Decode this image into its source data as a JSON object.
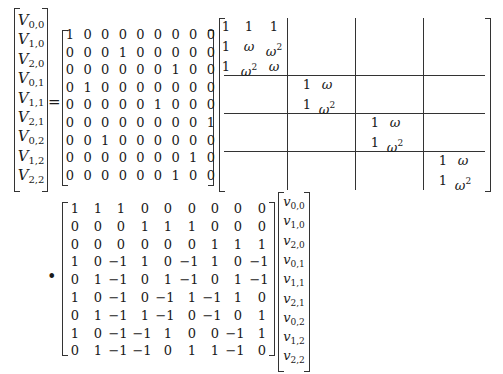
{
  "equation": {
    "lhs_vector": {
      "symbol": "V",
      "entries": [
        "0,0",
        "1,0",
        "2,0",
        "0,1",
        "1,1",
        "2,1",
        "0,2",
        "1,2",
        "2,2"
      ]
    },
    "equals": "=",
    "permutation_matrix": [
      [
        "1",
        "0",
        "0",
        "0",
        "0",
        "0",
        "0",
        "0",
        "0"
      ],
      [
        "0",
        "0",
        "0",
        "1",
        "0",
        "0",
        "0",
        "0",
        "0"
      ],
      [
        "0",
        "0",
        "0",
        "0",
        "0",
        "0",
        "1",
        "0",
        "0"
      ],
      [
        "0",
        "1",
        "0",
        "0",
        "0",
        "0",
        "0",
        "0",
        "0"
      ],
      [
        "0",
        "0",
        "0",
        "0",
        "0",
        "1",
        "0",
        "0",
        "0"
      ],
      [
        "0",
        "0",
        "0",
        "0",
        "0",
        "0",
        "0",
        "0",
        "1"
      ],
      [
        "0",
        "0",
        "1",
        "0",
        "0",
        "0",
        "0",
        "0",
        "0"
      ],
      [
        "0",
        "0",
        "0",
        "0",
        "0",
        "0",
        "0",
        "1",
        "0"
      ],
      [
        "0",
        "0",
        "0",
        "0",
        "0",
        "0",
        "1",
        "0",
        "0"
      ]
    ],
    "block_diagonal_matrix": {
      "block1": [
        [
          "1",
          "1",
          "1"
        ],
        [
          "1",
          "ω",
          "ω2"
        ],
        [
          "1",
          "ω2",
          "ω"
        ]
      ],
      "block2": [
        [
          "1",
          "ω"
        ],
        [
          "1",
          "ω2"
        ]
      ],
      "block3": [
        [
          "1",
          "ω"
        ],
        [
          "1",
          "ω2"
        ]
      ],
      "block4": [
        [
          "1",
          "ω"
        ],
        [
          "1",
          "ω2"
        ]
      ]
    },
    "operator": "•",
    "coefficient_matrix": [
      [
        "1",
        "1",
        "1",
        "0",
        "0",
        "0",
        "0",
        "0",
        "0"
      ],
      [
        "0",
        "0",
        "0",
        "1",
        "1",
        "1",
        "0",
        "0",
        "0"
      ],
      [
        "0",
        "0",
        "0",
        "0",
        "0",
        "0",
        "1",
        "1",
        "1"
      ],
      [
        "1",
        "0",
        "−1",
        "1",
        "0",
        "−1",
        "1",
        "0",
        "−1"
      ],
      [
        "0",
        "1",
        "−1",
        "0",
        "1",
        "−1",
        "0",
        "1",
        "−1"
      ],
      [
        "1",
        "0",
        "−1",
        "0",
        "−1",
        "1",
        "−1",
        "1",
        "0"
      ],
      [
        "0",
        "1",
        "−1",
        "1",
        "−1",
        "0",
        "−1",
        "0",
        "1"
      ],
      [
        "1",
        "0",
        "−1",
        "−1",
        "1",
        "0",
        "0",
        "−1",
        "1"
      ],
      [
        "0",
        "1",
        "−1",
        "−1",
        "0",
        "1",
        "1",
        "−1",
        "0"
      ]
    ],
    "rhs_vector": {
      "symbol": "v",
      "entries": [
        "0,0",
        "1,0",
        "2,0",
        "0,1",
        "1,1",
        "2,1",
        "0,2",
        "1,2",
        "2,2"
      ]
    }
  }
}
